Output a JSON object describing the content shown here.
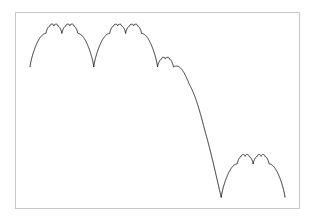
{
  "chart_data": {
    "type": "line",
    "title": "",
    "xlabel": "",
    "ylabel": "",
    "grid": false,
    "legend": null,
    "frame": {
      "left": 15,
      "top": 12,
      "right": 299,
      "bottom": 208
    },
    "curve_color": "#2a2a2a",
    "frame_color": "#c8c8c8",
    "segments": [
      "arch",
      "arch",
      "descent",
      "arch"
    ],
    "key_points": [
      {
        "x": 30,
        "y": 67,
        "label": "start"
      },
      {
        "x": 44,
        "y": 33,
        "label": "shoulder"
      },
      {
        "x": 53,
        "y": 24,
        "label": "peak"
      },
      {
        "x": 62,
        "y": 34,
        "label": "cusp"
      },
      {
        "x": 71,
        "y": 24,
        "label": "peak"
      },
      {
        "x": 80,
        "y": 33,
        "label": "shoulder"
      },
      {
        "x": 93,
        "y": 67,
        "label": "cusp"
      },
      {
        "x": 116,
        "y": 24,
        "label": "peak"
      },
      {
        "x": 134,
        "y": 24,
        "label": "peak"
      },
      {
        "x": 157,
        "y": 67,
        "label": "cusp"
      },
      {
        "x": 166,
        "y": 57,
        "label": "small-peak"
      },
      {
        "x": 174,
        "y": 66,
        "label": "shoulder"
      },
      {
        "x": 188,
        "y": 98,
        "label": "shoulder"
      },
      {
        "x": 205,
        "y": 135,
        "label": "shoulder"
      },
      {
        "x": 220,
        "y": 197,
        "label": "cusp-min"
      },
      {
        "x": 243,
        "y": 155,
        "label": "peak"
      },
      {
        "x": 261,
        "y": 155,
        "label": "peak"
      },
      {
        "x": 285,
        "y": 198,
        "label": "end"
      }
    ],
    "x_range": [
      30,
      285
    ],
    "y_range": [
      24,
      198
    ]
  }
}
